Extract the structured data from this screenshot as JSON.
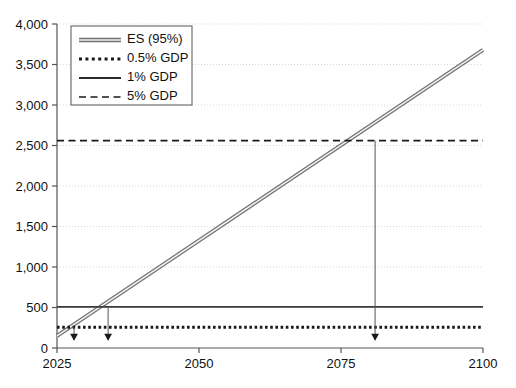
{
  "chart_data": {
    "type": "line",
    "title": "",
    "xlabel": "",
    "ylabel": "",
    "xlim": [
      2025,
      2100
    ],
    "ylim": [
      0,
      4000
    ],
    "grid": true,
    "xticks": [
      "2025",
      "2050",
      "2075",
      "2100"
    ],
    "xtick_values": [
      2025,
      2050,
      2075,
      2100
    ],
    "yticks": [
      "0",
      "500",
      "1,000",
      "1,500",
      "2,000",
      "2,500",
      "3,000",
      "3,500",
      "4,000"
    ],
    "ytick_values": [
      0,
      500,
      1000,
      1500,
      2000,
      2500,
      3000,
      3500,
      4000
    ],
    "legend_position": "upper left",
    "series": [
      {
        "name": "ES (95%)",
        "style": "band-line",
        "color": "#808080",
        "x": [
          2025,
          2100
        ],
        "values": [
          150,
          3680
        ]
      },
      {
        "name": "0.5% GDP",
        "style": "dotted",
        "color": "#1a1a1a",
        "x": [
          2025,
          2100
        ],
        "values": [
          255,
          255
        ]
      },
      {
        "name": "1% GDP",
        "style": "solid",
        "color": "#3a3a3a",
        "x": [
          2025,
          2100
        ],
        "values": [
          508,
          508
        ]
      },
      {
        "name": "5% GDP",
        "style": "dashed",
        "color": "#1a1a1a",
        "x": [
          2025,
          2100
        ],
        "values": [
          2560,
          2560
        ]
      }
    ],
    "annotations": [
      {
        "name": "crossing-0.5pct-gdp",
        "x": 2028,
        "y": 255,
        "marker": "down-arrow-to-axis"
      },
      {
        "name": "crossing-1pct-gdp",
        "x": 2034,
        "y": 508,
        "marker": "down-arrow-to-axis"
      },
      {
        "name": "crossing-5pct-gdp",
        "x": 2081,
        "y": 2560,
        "marker": "down-arrow-to-axis"
      }
    ]
  },
  "legend": {
    "entries": [
      {
        "label": "ES (95%)",
        "swatch": "band-line-swatch"
      },
      {
        "label": "0.5% GDP",
        "swatch": "dotted-line-swatch"
      },
      {
        "label": "1% GDP",
        "swatch": "solid-line-swatch"
      },
      {
        "label": "5% GDP",
        "swatch": "dashed-line-swatch"
      }
    ]
  },
  "colors": {
    "axis": "#555555",
    "grid": "#d8d8d8",
    "es_line": "#808080",
    "reference_line": "#222222",
    "text": "#111111",
    "background": "#ffffff"
  }
}
